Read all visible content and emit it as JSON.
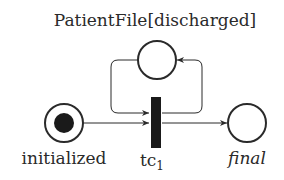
{
  "diagram": {
    "type": "petri-net",
    "title": "PatientFile[discharged]",
    "places": [
      {
        "id": "patientfile",
        "label": "PatientFile[discharged]",
        "tokens": 0
      },
      {
        "id": "initialized",
        "label": "initialized",
        "tokens": 1
      },
      {
        "id": "final",
        "label": "final",
        "tokens": 0
      }
    ],
    "transitions": [
      {
        "id": "tc1",
        "label_base": "tc",
        "label_sub": "1"
      }
    ],
    "arcs": [
      {
        "from": "initialized",
        "to": "tc1"
      },
      {
        "from": "patientfile",
        "to": "tc1"
      },
      {
        "from": "tc1",
        "to": "patientfile"
      },
      {
        "from": "tc1",
        "to": "final"
      }
    ],
    "colors": {
      "stroke": "#2a2a2a",
      "fill": "#ffffff",
      "token": "#1a1a1a",
      "transition": "#1a1a1a"
    }
  }
}
